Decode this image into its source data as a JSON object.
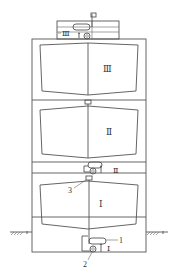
{
  "diagram": {
    "type": "engineering-sketch",
    "colors": {
      "line": "#555555",
      "background": "#ffffff",
      "text": "#333333"
    },
    "stages": [
      {
        "id": "stage-3",
        "label": "Ⅲ",
        "pump_label": "Ⅲ"
      },
      {
        "id": "stage-2",
        "label": "Ⅱ",
        "pump_label": "Ⅱ"
      },
      {
        "id": "stage-1",
        "label": "Ⅰ",
        "pump_label": "Ⅰ"
      }
    ],
    "callouts": [
      {
        "id": "1",
        "label": "1"
      },
      {
        "id": "2",
        "label": "2"
      },
      {
        "id": "3",
        "label": "3"
      }
    ]
  }
}
